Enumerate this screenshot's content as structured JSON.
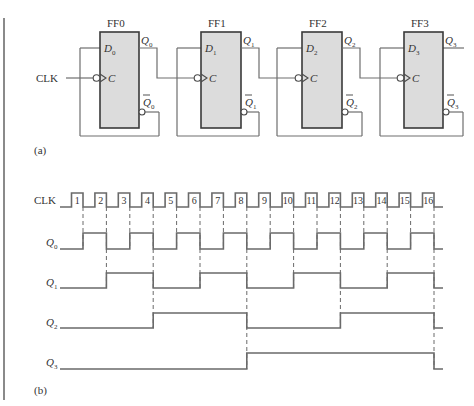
{
  "figure": {
    "part_a_label": "(a)",
    "part_b_label": "(b)",
    "clock_input_label": "CLK"
  },
  "flip_flops": [
    {
      "name": "FF0",
      "d_pin": "D",
      "d_sub": "0",
      "clk_pin": "C",
      "q": "Q",
      "q_sub": "0",
      "qbar": "Q",
      "qbar_sub": "0"
    },
    {
      "name": "FF1",
      "d_pin": "D",
      "d_sub": "1",
      "clk_pin": "C",
      "q": "Q",
      "q_sub": "1",
      "qbar": "Q",
      "qbar_sub": "1"
    },
    {
      "name": "FF2",
      "d_pin": "D",
      "d_sub": "2",
      "clk_pin": "C",
      "q": "Q",
      "q_sub": "2",
      "qbar": "Q",
      "qbar_sub": "2"
    },
    {
      "name": "FF3",
      "d_pin": "D",
      "d_sub": "3",
      "clk_pin": "C",
      "q": "Q",
      "q_sub": "3",
      "qbar": "Q",
      "qbar_sub": "3"
    }
  ],
  "timing": {
    "signals": [
      {
        "label": "CLK",
        "sub": ""
      },
      {
        "label": "Q",
        "sub": "0"
      },
      {
        "label": "Q",
        "sub": "1"
      },
      {
        "label": "Q",
        "sub": "2"
      },
      {
        "label": "Q",
        "sub": "3"
      }
    ],
    "pulse_numbers": [
      "1",
      "2",
      "3",
      "4",
      "5",
      "6",
      "7",
      "8",
      "9",
      "10",
      "11",
      "12",
      "13",
      "14",
      "15",
      "16"
    ],
    "levels_after_each_falling_edge": {
      "Q0": [
        1,
        0,
        1,
        0,
        1,
        0,
        1,
        0,
        1,
        0,
        1,
        0,
        1,
        0,
        1,
        0
      ],
      "Q1": [
        0,
        1,
        1,
        0,
        0,
        1,
        1,
        0,
        0,
        1,
        1,
        0,
        0,
        1,
        1,
        0
      ],
      "Q2": [
        0,
        0,
        0,
        1,
        1,
        1,
        1,
        0,
        0,
        0,
        0,
        1,
        1,
        1,
        1,
        0
      ],
      "Q3": [
        0,
        0,
        0,
        0,
        0,
        0,
        0,
        1,
        1,
        1,
        1,
        1,
        1,
        1,
        1,
        0
      ]
    },
    "initial_levels": {
      "Q0": 0,
      "Q1": 0,
      "Q2": 0,
      "Q3": 0
    }
  }
}
